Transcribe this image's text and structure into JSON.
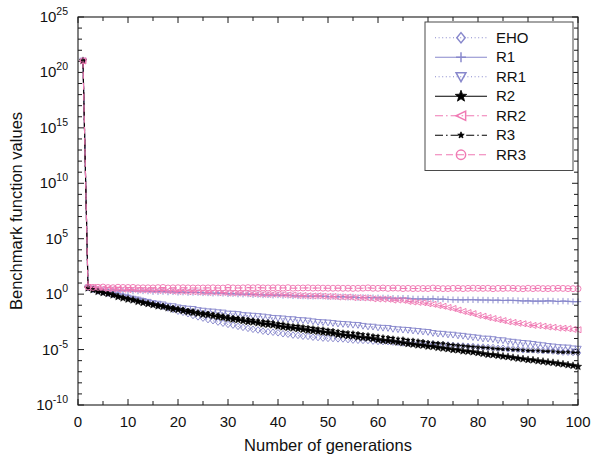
{
  "chart_data": {
    "type": "line",
    "title": "",
    "xlabel": "Number of generations",
    "ylabel": "Benchmark function values",
    "xlim": [
      0,
      100
    ],
    "ylim_log10": [
      -10,
      25
    ],
    "yscale": "log",
    "xticks": [
      0,
      10,
      20,
      30,
      40,
      50,
      60,
      70,
      80,
      90,
      100
    ],
    "xtick_labels": [
      "0",
      "10",
      "20",
      "30",
      "40",
      "50",
      "60",
      "70",
      "80",
      "90",
      "100"
    ],
    "yticks_log10": [
      -10,
      -5,
      0,
      5,
      10,
      15,
      20,
      25
    ],
    "ytick_labels": [
      "10-10",
      "10-5",
      "100",
      "105",
      "1010",
      "1015",
      "1020",
      "1025"
    ],
    "ytick_mantissa": [
      "10",
      "10",
      "10",
      "10",
      "10",
      "10",
      "10",
      "10"
    ],
    "ytick_exponents": [
      "-10",
      "-5",
      "0",
      "5",
      "10",
      "15",
      "20",
      "25"
    ],
    "grid": false,
    "legend_position": "upper right",
    "minor_ticks": true,
    "series": [
      {
        "name": "EHO",
        "color": "#8888cc",
        "marker": "diamond",
        "linestyle": "dotted",
        "x": [
          1,
          2,
          3,
          4,
          6,
          8,
          10,
          13,
          16,
          20,
          24,
          28,
          32,
          36,
          40,
          45,
          50,
          55,
          60,
          65,
          70,
          75,
          80,
          85,
          90,
          95,
          100
        ],
        "y_log10": [
          21.05,
          0.62,
          0.45,
          0.33,
          0.12,
          -0.08,
          -0.28,
          -0.62,
          -0.98,
          -1.52,
          -2.05,
          -2.52,
          -2.92,
          -3.25,
          -3.5,
          -3.78,
          -3.98,
          -4.12,
          -4.25,
          -4.38,
          -4.5,
          -4.62,
          -4.76,
          -4.9,
          -5.02,
          -5.15,
          -5.28
        ]
      },
      {
        "name": "R1",
        "color": "#8888cc",
        "marker": "plus",
        "linestyle": "solid",
        "x": [
          1,
          2,
          3,
          4,
          6,
          8,
          10,
          14,
          18,
          22,
          26,
          30,
          35,
          40,
          45,
          50,
          55,
          60,
          65,
          70,
          75,
          80,
          85,
          90,
          95,
          100
        ],
        "y_log10": [
          21.05,
          0.6,
          0.5,
          0.45,
          0.38,
          0.33,
          0.3,
          0.25,
          0.2,
          0.15,
          0.1,
          0.05,
          -0.02,
          -0.1,
          -0.16,
          -0.22,
          -0.28,
          -0.33,
          -0.38,
          -0.43,
          -0.48,
          -0.52,
          -0.56,
          -0.6,
          -0.63,
          -0.66
        ]
      },
      {
        "name": "RR1",
        "color": "#8888cc",
        "marker": "triangle-down",
        "linestyle": "dotted",
        "x": [
          1,
          2,
          3,
          4,
          6,
          8,
          10,
          14,
          18,
          22,
          26,
          30,
          35,
          40,
          45,
          50,
          55,
          60,
          65,
          70,
          75,
          80,
          85,
          90,
          95,
          100
        ],
        "y_log10": [
          21.05,
          0.58,
          0.42,
          0.3,
          0.1,
          -0.12,
          -0.35,
          -0.72,
          -1.05,
          -1.32,
          -1.55,
          -1.75,
          -1.98,
          -2.18,
          -2.38,
          -2.58,
          -2.78,
          -3.0,
          -3.22,
          -3.45,
          -3.7,
          -3.95,
          -4.2,
          -4.48,
          -4.72,
          -4.95
        ]
      },
      {
        "name": "R2",
        "color": "#000000",
        "marker": "star",
        "linestyle": "solid",
        "x": [
          1,
          2,
          3,
          4,
          6,
          8,
          10,
          14,
          18,
          22,
          26,
          30,
          35,
          40,
          45,
          50,
          55,
          60,
          65,
          70,
          75,
          80,
          85,
          90,
          95,
          100
        ],
        "y_log10": [
          21.05,
          0.55,
          0.38,
          0.25,
          0.02,
          -0.22,
          -0.45,
          -0.88,
          -1.25,
          -1.58,
          -1.9,
          -2.2,
          -2.55,
          -2.88,
          -3.2,
          -3.5,
          -3.8,
          -4.1,
          -4.4,
          -4.7,
          -5.0,
          -5.3,
          -5.6,
          -5.9,
          -6.2,
          -6.5
        ]
      },
      {
        "name": "RR2",
        "color": "#f07ab4",
        "marker": "triangle-left",
        "linestyle": "dashdot",
        "x": [
          1,
          2,
          3,
          4,
          6,
          8,
          10,
          14,
          18,
          22,
          26,
          30,
          35,
          40,
          45,
          50,
          55,
          60,
          65,
          70,
          75,
          80,
          85,
          90,
          95,
          100
        ],
        "y_log10": [
          21.05,
          0.62,
          0.58,
          0.55,
          0.5,
          0.46,
          0.42,
          0.36,
          0.3,
          0.24,
          0.18,
          0.12,
          0.04,
          -0.04,
          -0.12,
          -0.2,
          -0.3,
          -0.42,
          -0.58,
          -0.85,
          -1.3,
          -1.9,
          -2.4,
          -2.75,
          -3.0,
          -3.2
        ]
      },
      {
        "name": "R3",
        "color": "#000000",
        "marker": "star-small",
        "linestyle": "dashdot",
        "x": [
          1,
          2,
          3,
          4,
          6,
          8,
          10,
          14,
          18,
          22,
          26,
          30,
          35,
          40,
          45,
          50,
          55,
          60,
          65,
          70,
          75,
          80,
          85,
          90,
          95,
          100
        ],
        "y_log10": [
          21.05,
          0.56,
          0.4,
          0.28,
          0.06,
          -0.15,
          -0.38,
          -0.78,
          -1.12,
          -1.44,
          -1.72,
          -2.0,
          -2.32,
          -2.62,
          -2.92,
          -3.2,
          -3.5,
          -3.78,
          -4.05,
          -4.32,
          -4.55,
          -4.78,
          -4.95,
          -5.08,
          -5.18,
          -5.26
        ]
      },
      {
        "name": "RR3",
        "color": "#f07ab4",
        "marker": "circle",
        "linestyle": "dashed",
        "x": [
          1,
          2,
          3,
          4,
          6,
          8,
          10,
          14,
          18,
          22,
          26,
          30,
          35,
          40,
          45,
          50,
          55,
          60,
          65,
          70,
          75,
          80,
          85,
          90,
          95,
          100
        ],
        "y_log10": [
          21.05,
          0.65,
          0.63,
          0.62,
          0.61,
          0.6,
          0.6,
          0.59,
          0.58,
          0.58,
          0.57,
          0.57,
          0.56,
          0.56,
          0.55,
          0.55,
          0.54,
          0.54,
          0.53,
          0.53,
          0.52,
          0.52,
          0.51,
          0.51,
          0.5,
          0.5
        ]
      }
    ]
  },
  "legend": {
    "entries": [
      {
        "label": "EHO"
      },
      {
        "label": "R1"
      },
      {
        "label": "RR1"
      },
      {
        "label": "R2"
      },
      {
        "label": "RR2"
      },
      {
        "label": "R3"
      },
      {
        "label": "RR3"
      }
    ]
  },
  "colors": {
    "purple": "#8888cc",
    "pink": "#f07ab4",
    "black": "#000000",
    "axis": "#1a1a1a",
    "background": "#ffffff"
  }
}
